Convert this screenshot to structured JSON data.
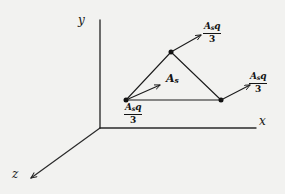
{
  "figure": {
    "background_color": "#f2f2f0",
    "ink_color": "#1b1b1b"
  },
  "axes": {
    "y_label": "y",
    "x_label": "x",
    "z_label": "z",
    "origin": {
      "x": 100,
      "y": 128
    },
    "y_tip": {
      "x": 100,
      "y": 20
    },
    "x_tip": {
      "x": 256,
      "y": 128
    },
    "z_tip": {
      "x": 31,
      "y": 178
    }
  },
  "surface": {
    "area_label": "A",
    "area_subscript": "s",
    "vertices": [
      {
        "name": "apex",
        "x": 171,
        "y": 52
      },
      {
        "name": "bottom-left",
        "x": 126,
        "y": 100
      },
      {
        "name": "bottom-right",
        "x": 221,
        "y": 100
      }
    ]
  },
  "vectors": [
    {
      "id": "apex-vector",
      "numerator_main": "A",
      "numerator_sub": "s",
      "numerator_tail": "q",
      "denominator": "3",
      "from": {
        "x": 171,
        "y": 52
      },
      "to": {
        "x": 203,
        "y": 34
      }
    },
    {
      "id": "left-vector",
      "numerator_main": "A",
      "numerator_sub": "s",
      "numerator_tail": "q",
      "denominator": "3",
      "from": {
        "x": 126,
        "y": 100
      },
      "to": {
        "x": 162,
        "y": 84
      }
    },
    {
      "id": "right-vector",
      "numerator_main": "A",
      "numerator_sub": "s",
      "numerator_tail": "q",
      "denominator": "3",
      "from": {
        "x": 221,
        "y": 100
      },
      "to": {
        "x": 252,
        "y": 84
      }
    }
  ]
}
